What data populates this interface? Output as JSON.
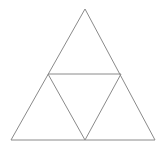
{
  "figure": {
    "name": "subdivided-equilateral-triangle",
    "title": "Equilateral triangle divided into four congruent triangles",
    "background_color": "#ffffff",
    "stroke_color": "#8a8a8a",
    "stroke_width": 1,
    "canvas": {
      "width": 165,
      "height": 152
    },
    "points": {
      "apex": {
        "label": "A",
        "x": 85,
        "y": 9
      },
      "bottom_left": {
        "label": "B",
        "x": 11,
        "y": 140
      },
      "bottom_right": {
        "label": "C",
        "x": 155,
        "y": 140
      },
      "mid_left": {
        "label": "M_AB",
        "x": 48,
        "y": 74
      },
      "mid_right": {
        "label": "M_AC",
        "x": 121,
        "y": 74
      },
      "mid_bottom": {
        "label": "M_BC",
        "x": 85,
        "y": 140
      }
    },
    "outer_triangle": {
      "name": "outer-triangle",
      "path": "M 85 9 L 155 140 L 11 140 Z"
    },
    "sub_triangles": [
      {
        "name": "top-sub-triangle",
        "orientation": "upright",
        "path": "M 85 9 L 121 74 L 48 74 Z"
      },
      {
        "name": "left-sub-triangle",
        "orientation": "upright",
        "path": "M 48 74 L 85 140 L 11 140 Z"
      },
      {
        "name": "right-sub-triangle",
        "orientation": "upright",
        "path": "M 121 74 L 155 140 L 85 140 Z"
      },
      {
        "name": "center-inverted-triangle",
        "orientation": "inverted",
        "path": "M 48 74 L 121 74 L 85 140 Z"
      }
    ],
    "internal_segments": [
      {
        "name": "midsegment-horizontal",
        "from": "mid_left",
        "to": "mid_right",
        "path": "M 48 74 L 121 74"
      },
      {
        "name": "midsegment-left",
        "from": "mid_left",
        "to": "mid_bottom",
        "path": "M 48 74 L 85 140"
      },
      {
        "name": "midsegment-right",
        "from": "mid_right",
        "to": "mid_bottom",
        "path": "M 121 74 L 85 140"
      }
    ],
    "counts": {
      "sub_triangles": 4,
      "upright": 3,
      "inverted": 1
    }
  }
}
